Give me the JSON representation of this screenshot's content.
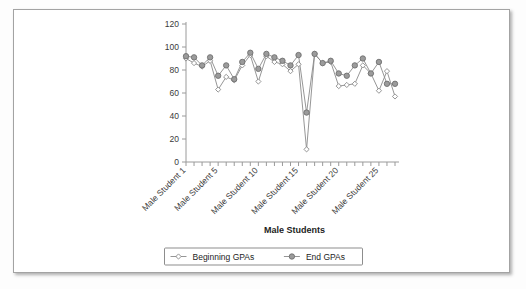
{
  "panel": {
    "border_color": "#a3a3a3",
    "background": "#ffffff"
  },
  "chart_data": {
    "type": "line",
    "title": "",
    "xlabel": "Male Students",
    "ylabel": "",
    "ylim": [
      0,
      120
    ],
    "ytick_values": [
      0,
      20,
      40,
      60,
      80,
      100,
      120
    ],
    "ytick_labels": [
      "0",
      "20",
      "40",
      "60",
      "80",
      "100",
      "120"
    ],
    "grid": false,
    "legend_position": "bottom",
    "x_indices": [
      1,
      2,
      3,
      4,
      5,
      6,
      7,
      8,
      9,
      10,
      11,
      12,
      13,
      14,
      15,
      16,
      17,
      18,
      19,
      20,
      21,
      22,
      23,
      24,
      25,
      26,
      27
    ],
    "xtick_labeled": [
      {
        "index": 1,
        "label": "Male Student 1"
      },
      {
        "index": 5,
        "label": "Male Student 5"
      },
      {
        "index": 10,
        "label": "Male Student 10"
      },
      {
        "index": 15,
        "label": "Male Student 15"
      },
      {
        "index": 20,
        "label": "Male Student 20"
      },
      {
        "index": 25,
        "label": "Male Student 25"
      }
    ],
    "series": [
      {
        "name": "Beginning GPAs",
        "marker": "open-diamond",
        "color": "#8a8a8a",
        "values": [
          90,
          86,
          83,
          88,
          63,
          74,
          71,
          84,
          93,
          70,
          92,
          87,
          85,
          79,
          85,
          11,
          94,
          86,
          87,
          66,
          67,
          68,
          84,
          77,
          62,
          79,
          57
        ]
      },
      {
        "name": "End GPAs",
        "marker": "filled-circle",
        "color": "#9b9b9b",
        "values": [
          92,
          91,
          84,
          91,
          75,
          84,
          72,
          87,
          95,
          81,
          94,
          91,
          88,
          84,
          93,
          43,
          94,
          86,
          88,
          77,
          75,
          84,
          90,
          77,
          87,
          68,
          68
        ]
      }
    ]
  },
  "legend": {
    "entries": [
      {
        "label": "Beginning GPAs",
        "marker": "open-diamond"
      },
      {
        "label": "End GPAs",
        "marker": "filled-circle"
      }
    ]
  }
}
